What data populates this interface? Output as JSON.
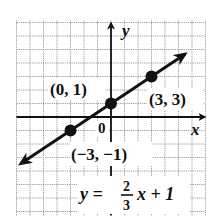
{
  "chart_data": {
    "type": "line",
    "title": "",
    "xlabel": "x",
    "ylabel": "y",
    "xlim": [
      -7,
      7
    ],
    "ylim": [
      -7,
      7
    ],
    "grid": true,
    "equation": {
      "lhs": "y =",
      "numerator": "2",
      "denominator": "3",
      "rhs": "x + 1",
      "slope": 0.6667,
      "intercept": 1
    },
    "series": [
      {
        "name": "y = 2/3 x + 1",
        "x": [
          -3,
          0,
          3
        ],
        "y": [
          -1,
          1,
          3
        ]
      }
    ],
    "points": [
      {
        "x": -3,
        "y": -1,
        "label": "(−3, −1)"
      },
      {
        "x": 0,
        "y": 1,
        "label": "(0, 1)"
      },
      {
        "x": 3,
        "y": 3,
        "label": "(3, 3)"
      }
    ],
    "origin_label": "0",
    "line_extent": {
      "x_start": -6.7,
      "x_end": 5.5
    }
  },
  "colors": {
    "grid": "#9a9a9a",
    "axes": "#111111",
    "line": "#111111",
    "background": "#ffffff"
  }
}
